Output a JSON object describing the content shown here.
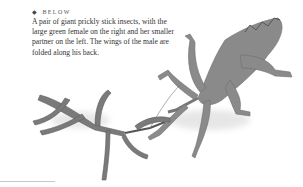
{
  "caption": {
    "label_icon": "diamond-bullet-icon",
    "label": "BELOW",
    "text": "A pair of giant prickly stick insects, with the large green female on the right and her smaller partner on the left. The wings of the male are folded along his back."
  },
  "image": {
    "subject": "giant prickly stick insects (male and female)",
    "color_mode": "grayscale"
  }
}
